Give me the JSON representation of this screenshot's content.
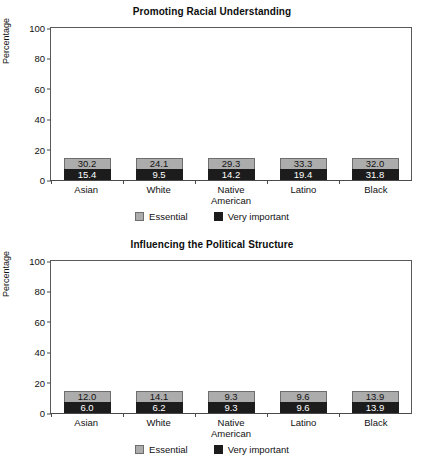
{
  "chart_data": [
    {
      "type": "bar",
      "title": "Promoting Racial Understanding",
      "xlabel": "",
      "ylabel": "Percentage",
      "ylim": [
        0,
        100
      ],
      "yticks": [
        100,
        80,
        60,
        40,
        20,
        0
      ],
      "grid": false,
      "stacked": true,
      "legend_position": "bottom",
      "categories": [
        "Asian",
        "White",
        "Native American",
        "Latino",
        "Black"
      ],
      "series": [
        {
          "name": "Very important",
          "color": "#1c1c1c",
          "values": [
            15.4,
            9.5,
            14.2,
            19.4,
            31.8
          ]
        },
        {
          "name": "Essential",
          "color": "#acacac",
          "values": [
            30.2,
            24.1,
            29.3,
            33.3,
            32.0
          ]
        }
      ],
      "totals": [
        45.6,
        33.6,
        43.5,
        52.7,
        63.8
      ]
    },
    {
      "type": "bar",
      "title": "Influencing the Political Structure",
      "xlabel": "",
      "ylabel": "Percentage",
      "ylim": [
        0,
        100
      ],
      "yticks": [
        100,
        80,
        60,
        40,
        20,
        0
      ],
      "grid": false,
      "stacked": true,
      "legend_position": "bottom",
      "categories": [
        "Asian",
        "White",
        "Native American",
        "Latino",
        "Black"
      ],
      "series": [
        {
          "name": "Very important",
          "color": "#1c1c1c",
          "values": [
            6.0,
            6.2,
            9.3,
            9.6,
            13.9
          ]
        },
        {
          "name": "Essential",
          "color": "#acacac",
          "values": [
            12.0,
            14.1,
            9.3,
            9.6,
            13.9
          ]
        }
      ],
      "totals": [
        18.0,
        20.3,
        18.6,
        19.2,
        27.8
      ]
    }
  ],
  "charts": [
    {
      "title": "Promoting Racial Understanding",
      "ylabel": "Percentage",
      "yticks": [
        "100",
        "80",
        "60",
        "40",
        "20",
        "0"
      ],
      "categories": [
        {
          "line1": "Asian",
          "line2": ""
        },
        {
          "line1": "White",
          "line2": ""
        },
        {
          "line1": "Native",
          "line2": "American"
        },
        {
          "line1": "Latino",
          "line2": ""
        },
        {
          "line1": "Black",
          "line2": ""
        }
      ],
      "bars": [
        {
          "top_label": "30.2",
          "bottom_label": "15.4",
          "top_value": 30.2,
          "bottom_value": 15.4
        },
        {
          "top_label": "24.1",
          "bottom_label": "9.5",
          "top_value": 24.1,
          "bottom_value": 9.5
        },
        {
          "top_label": "29.3",
          "bottom_label": "14.2",
          "top_value": 29.3,
          "bottom_value": 14.2
        },
        {
          "top_label": "33.3",
          "bottom_label": "19.4",
          "top_value": 33.3,
          "bottom_value": 19.4
        },
        {
          "top_label": "32.0",
          "bottom_label": "31.8",
          "top_value": 32.0,
          "bottom_value": 31.8
        }
      ],
      "legend": [
        {
          "label": "Essential",
          "swatch": "essential"
        },
        {
          "label": "Very important",
          "swatch": "very"
        }
      ]
    },
    {
      "title": "Influencing the Political Structure",
      "ylabel": "Percentage",
      "yticks": [
        "100",
        "80",
        "60",
        "40",
        "20",
        "0"
      ],
      "categories": [
        {
          "line1": "Asian",
          "line2": ""
        },
        {
          "line1": "White",
          "line2": ""
        },
        {
          "line1": "Native",
          "line2": "American"
        },
        {
          "line1": "Latino",
          "line2": ""
        },
        {
          "line1": "Black",
          "line2": ""
        }
      ],
      "bars": [
        {
          "top_label": "12.0",
          "bottom_label": "6.0",
          "top_value": 12.0,
          "bottom_value": 6.0
        },
        {
          "top_label": "14.1",
          "bottom_label": "6.2",
          "top_value": 14.1,
          "bottom_value": 6.2
        },
        {
          "top_label": "9.3",
          "bottom_label": "9.3",
          "top_value": 9.3,
          "bottom_value": 9.3
        },
        {
          "top_label": "9.6",
          "bottom_label": "9.6",
          "top_value": 9.6,
          "bottom_value": 9.6
        },
        {
          "top_label": "13.9",
          "bottom_label": "13.9",
          "top_value": 13.9,
          "bottom_value": 13.9
        }
      ],
      "legend": [
        {
          "label": "Essential",
          "swatch": "essential"
        },
        {
          "label": "Very important",
          "swatch": "very"
        }
      ]
    }
  ]
}
